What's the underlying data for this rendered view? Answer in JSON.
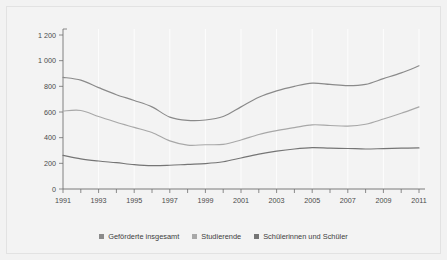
{
  "chart_data": {
    "type": "line",
    "title": "",
    "subtitle": "",
    "xlabel": "",
    "ylabel": "",
    "grid": "vertical-only",
    "legend_position": "bottom-center",
    "x": [
      1991,
      1992,
      1993,
      1994,
      1995,
      1996,
      1997,
      1998,
      1999,
      2000,
      2001,
      2002,
      2003,
      2004,
      2005,
      2006,
      2007,
      2008,
      2009,
      2010,
      2011
    ],
    "xlim": [
      1991,
      2011
    ],
    "ylim": [
      0,
      1200
    ],
    "y_ticks": [
      0,
      200,
      400,
      600,
      800,
      1000,
      1200
    ],
    "y_tick_labels": [
      "0",
      "200",
      "400",
      "600",
      "800",
      "1 000",
      "1 200"
    ],
    "x_tick_labels": [
      "1991",
      "1993",
      "1995",
      "1997",
      "1999",
      "2001",
      "2003",
      "2005",
      "2007",
      "2009",
      "2011"
    ],
    "x_minor_ticks": [
      1991,
      1992,
      1993,
      1994,
      1995,
      1996,
      1997,
      1998,
      1999,
      2000,
      2001,
      2002,
      2003,
      2004,
      2005,
      2006,
      2007,
      2008,
      2009,
      2010,
      2011
    ],
    "series": [
      {
        "name": "Geförderte insgesamt",
        "color": "#8a8a8a",
        "values": [
          870,
          848,
          790,
          735,
          690,
          640,
          560,
          535,
          538,
          565,
          640,
          715,
          765,
          800,
          825,
          815,
          805,
          815,
          860,
          905,
          960
        ]
      },
      {
        "name": "Studierende",
        "color": "#a8a8a8",
        "values": [
          608,
          612,
          565,
          520,
          480,
          440,
          375,
          342,
          345,
          348,
          382,
          425,
          455,
          478,
          500,
          495,
          490,
          505,
          545,
          590,
          640
        ]
      },
      {
        "name": "Schülerinnen und Schüler",
        "color": "#757575",
        "values": [
          262,
          235,
          218,
          205,
          190,
          182,
          185,
          192,
          198,
          212,
          242,
          272,
          295,
          312,
          322,
          318,
          316,
          312,
          315,
          318,
          320
        ]
      }
    ]
  },
  "legend": {
    "items": [
      {
        "label": "Geförderte insgesamt",
        "color": "#8a8a8a"
      },
      {
        "label": "Studierende",
        "color": "#a8a8a8"
      },
      {
        "label": "Schülerinnen und Schüler",
        "color": "#757575"
      }
    ]
  },
  "colors": {
    "background": "#f2f2f2",
    "panel": "#f3f3f3",
    "axis": "#6e6e6e",
    "grid": "#ffffff",
    "text": "#4a4a4a",
    "border": "#e2e2e2"
  }
}
